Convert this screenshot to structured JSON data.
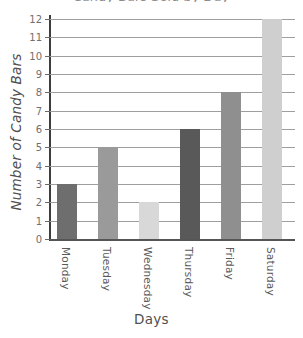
{
  "chart_data": {
    "type": "bar",
    "title": "Candy Bars Sold by Day",
    "xlabel": "Days",
    "ylabel": "Number of Candy Bars",
    "categories": [
      "Monday",
      "Tuesday",
      "Wednesday",
      "Thursday",
      "Friday",
      "Saturday"
    ],
    "values": [
      3,
      5,
      2,
      6,
      8,
      12
    ],
    "ylim": [
      0,
      12
    ],
    "yticks": [
      0,
      1,
      2,
      3,
      4,
      5,
      6,
      7,
      8,
      9,
      10,
      11,
      12
    ],
    "ytick_labels": [
      "0",
      "1",
      "2",
      "3",
      "4",
      "5",
      "6",
      "7",
      "8",
      "9",
      "10",
      "11",
      "12"
    ],
    "grid": true,
    "legend": false,
    "bar_colors": [
      "#6e6e6e",
      "#9a9a9a",
      "#d8d8d8",
      "#595959",
      "#8f8f8f",
      "#cfcfcf"
    ],
    "axis_color": "#3d3d3d",
    "grid_color": "#9e9e9e"
  }
}
